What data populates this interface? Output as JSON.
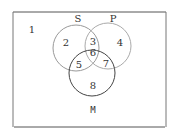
{
  "diagram": {
    "type": "venn",
    "sets": [
      {
        "name": "S",
        "label": "S"
      },
      {
        "name": "P",
        "label": "P"
      },
      {
        "name": "M",
        "label": "M"
      }
    ],
    "regions": {
      "r1": "1",
      "r2": "2",
      "r3": "3",
      "r4": "4",
      "r5": "5",
      "r6": "6",
      "r7": "7",
      "r8": "8"
    },
    "colors": {
      "stroke": "#444444",
      "light_stroke": "#999999",
      "text": "#333333"
    }
  }
}
